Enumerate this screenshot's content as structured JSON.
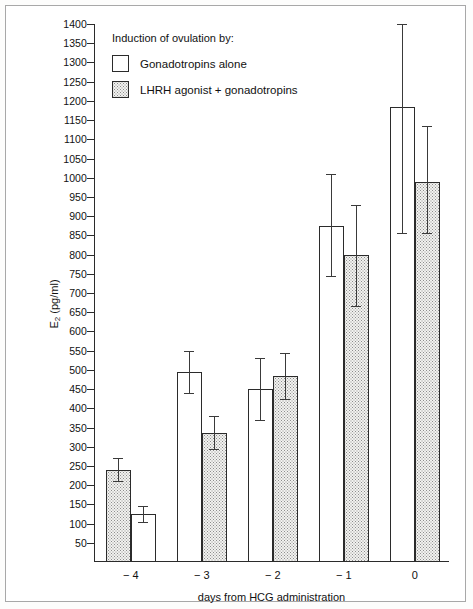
{
  "legend": {
    "title": "Induction of ovulation by:",
    "entries": [
      {
        "label": "Gonadotropins alone",
        "style": "open"
      },
      {
        "label": "LHRH agonist + gonadotropins",
        "style": "dotted"
      }
    ]
  },
  "axes": {
    "y_title_main": "E",
    "y_title_sub": "2",
    "y_title_unit": " (pg/ml)",
    "x_title": "days from HCG administration"
  },
  "chart_data": {
    "type": "bar",
    "title": "",
    "subtitle": "",
    "xlabel": "days from HCG administration",
    "ylabel": "E2 (pg/ml)",
    "ylim": [
      0,
      1400
    ],
    "ytick_step": 50,
    "ytick_labels": [
      "50",
      "100",
      "150",
      "200",
      "250",
      "300",
      "350",
      "400",
      "450",
      "500",
      "550",
      "600",
      "650",
      "700",
      "750",
      "800",
      "850",
      "900",
      "950",
      "1000",
      "1050",
      "1100",
      "1150",
      "1200",
      "1250",
      "1300",
      "1350",
      "1400"
    ],
    "grid": false,
    "legend_position": "top-left-inside",
    "categories": [
      "-4",
      "-3",
      "-2",
      "-1",
      "0"
    ],
    "group_order": [
      [
        "LHRH agonist + gonadotropins",
        "Gonadotropins alone"
      ],
      [
        "Gonadotropins alone",
        "LHRH agonist + gonadotropins"
      ],
      [
        "Gonadotropins alone",
        "LHRH agonist + gonadotropins"
      ],
      [
        "Gonadotropins alone",
        "LHRH agonist + gonadotropins"
      ],
      [
        "Gonadotropins alone",
        "LHRH agonist + gonadotropins"
      ]
    ],
    "series": [
      {
        "name": "Gonadotropins alone",
        "style": "open",
        "values": [
          125,
          495,
          450,
          875,
          1185
        ],
        "err_low": [
          105,
          440,
          370,
          745,
          855
        ],
        "err_high": [
          145,
          550,
          530,
          1010,
          1400
        ]
      },
      {
        "name": "LHRH agonist + gonadotropins",
        "style": "dotted",
        "values": [
          240,
          335,
          485,
          800,
          990
        ],
        "err_low": [
          210,
          295,
          425,
          665,
          855
        ],
        "err_high": [
          270,
          380,
          545,
          930,
          1135
        ]
      }
    ]
  }
}
